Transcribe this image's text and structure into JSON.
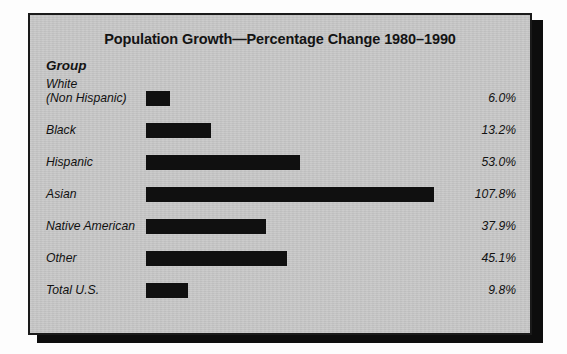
{
  "panel": {
    "background_color": "#c9c9c9",
    "border_color": "#1a1a1a",
    "bar_color": "#101010"
  },
  "chart_data": {
    "type": "bar",
    "orientation": "horizontal",
    "title": "Population Growth—Percentage Change 1980–1990",
    "xlabel": "",
    "ylabel": "Group",
    "group_header": "Group",
    "grid": false,
    "legend": null,
    "value_suffix": "%",
    "xlim": [
      0,
      107.8
    ],
    "categories": [
      "White\n(Non Hispanic)",
      "Black",
      "Hispanic",
      "Asian",
      "Native American",
      "Other",
      "Total U.S."
    ],
    "values": [
      6.0,
      13.2,
      53.0,
      107.8,
      37.9,
      45.1,
      9.8
    ],
    "value_labels": [
      "6.0%",
      "13.2%",
      "53.0%",
      "107.8%",
      "37.9%",
      "45.1%",
      "9.8%"
    ],
    "rows": [
      {
        "label": "White\n(Non Hispanic)",
        "value": 6.0,
        "value_label": "6.0%",
        "bar_pct": 8.4,
        "two_line": true
      },
      {
        "label": "Black",
        "value": 13.2,
        "value_label": "13.2%",
        "bar_pct": 22.5,
        "two_line": false
      },
      {
        "label": "Hispanic",
        "value": 53.0,
        "value_label": "53.0%",
        "bar_pct": 53.5,
        "two_line": false
      },
      {
        "label": "Asian",
        "value": 107.8,
        "value_label": "107.8%",
        "bar_pct": 100,
        "two_line": false
      },
      {
        "label": "Native American",
        "value": 37.9,
        "value_label": "37.9%",
        "bar_pct": 41.5,
        "two_line": false
      },
      {
        "label": "Other",
        "value": 45.1,
        "value_label": "45.1%",
        "bar_pct": 49.0,
        "two_line": false
      },
      {
        "label": "Total U.S.",
        "value": 9.8,
        "value_label": "9.8%",
        "bar_pct": 14.5,
        "two_line": false
      }
    ]
  }
}
